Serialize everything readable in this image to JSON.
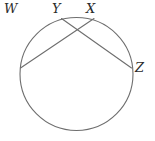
{
  "figure": {
    "shape": "circle",
    "stroke_color": "#6e6e6e",
    "label_color": "#2b2b2b",
    "background_color": "#ffffff",
    "stroke_width": 1
  },
  "chart_data": {
    "type": "diagram",
    "xlabel": "",
    "ylabel": "",
    "xlim": [
      0,
      155
    ],
    "ylim": [
      0,
      141
    ],
    "grid": false,
    "legend": null,
    "circle": {
      "name": "circle",
      "cx": 76.5,
      "cy": 74,
      "r": 58.5
    },
    "points": [
      {
        "id": "W",
        "label": "W",
        "cx": 20.5,
        "cy": 68.0,
        "label_x": 4,
        "label_y": 2
      },
      {
        "id": "X",
        "label": "X",
        "cx": 94.0,
        "cy": 18.5,
        "label_x": 86,
        "label_y": 2
      },
      {
        "id": "Y",
        "label": "Y",
        "cx": 61.5,
        "cy": 18.5,
        "label_x": 52,
        "label_y": 2
      },
      {
        "id": "Z",
        "label": "Z",
        "cx": 131.5,
        "cy": 68.0,
        "label_x": 135,
        "label_y": 61
      }
    ],
    "chords": [
      {
        "name": "chord-WX",
        "from": "W",
        "to": "X",
        "x1": 20.5,
        "y1": 68.0,
        "x2": 94.0,
        "y2": 18.5
      },
      {
        "name": "chord-YZ",
        "from": "Y",
        "to": "Z",
        "x1": 61.5,
        "y1": 18.5,
        "x2": 131.5,
        "y2": 68.0
      }
    ],
    "intersection": {
      "name": "chord-intersection",
      "x": 79.0,
      "y": 37.0
    }
  }
}
